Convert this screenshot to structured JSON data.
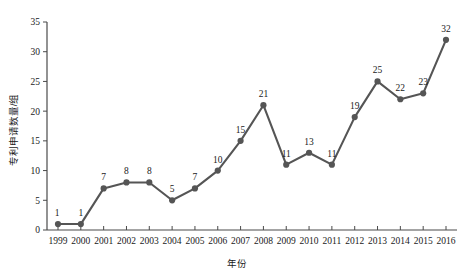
{
  "chart_data": {
    "type": "line",
    "title": "",
    "xlabel": "年份",
    "ylabel": "专利申请数量/组",
    "categories": [
      "1999",
      "2000",
      "2001",
      "2002",
      "2003",
      "2004",
      "2005",
      "2006",
      "2007",
      "2008",
      "2009",
      "2010",
      "2011",
      "2012",
      "2013",
      "2014",
      "2015",
      "2016"
    ],
    "values": [
      1,
      1,
      7,
      8,
      8,
      5,
      7,
      10,
      15,
      21,
      11,
      13,
      11,
      19,
      25,
      22,
      23,
      32
    ],
    "point_labels": [
      "1",
      "1",
      "7",
      "8",
      "8",
      "5",
      "7",
      "10",
      "15",
      "21",
      "11",
      "13",
      "11",
      "19",
      "25",
      "22",
      "23",
      "32"
    ],
    "ylim": [
      0,
      35
    ],
    "yticks": [
      0,
      5,
      10,
      15,
      20,
      25,
      30,
      35
    ],
    "ytick_labels": [
      "0",
      "5",
      "10",
      "15",
      "20",
      "25",
      "30",
      "35"
    ],
    "grid": false,
    "legend": "none",
    "series_color": "#555555",
    "marker_color": "#555555",
    "axis_color": "#4a4a4a",
    "background": "#ffffff"
  }
}
